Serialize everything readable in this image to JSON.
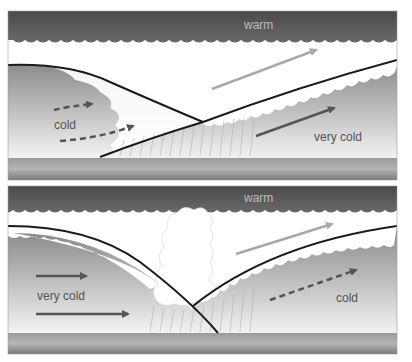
{
  "diagram": {
    "type": "weather-fronts-occlusion",
    "panels": [
      {
        "id": "top",
        "labels": {
          "warm": "warm",
          "cold": "cold",
          "very_cold": "very cold"
        },
        "arrows": [
          {
            "name": "warm-air-arrow",
            "style": "solid",
            "color": "#a0a0a0"
          },
          {
            "name": "very-cold-air-arrow",
            "style": "solid",
            "color": "#555555"
          },
          {
            "name": "cold-air-arrow-upper",
            "style": "dashed",
            "color": "#555555"
          },
          {
            "name": "cold-air-arrow-lower",
            "style": "dashed",
            "color": "#555555"
          }
        ]
      },
      {
        "id": "bottom",
        "labels": {
          "warm": "warm",
          "very_cold": "very cold",
          "cold": "cold"
        },
        "arrows": [
          {
            "name": "warm-air-arrow",
            "style": "solid",
            "color": "#a0a0a0"
          },
          {
            "name": "very-cold-air-arrow-upper",
            "style": "solid",
            "color": "#555555"
          },
          {
            "name": "very-cold-air-arrow-lower",
            "style": "solid",
            "color": "#555555"
          },
          {
            "name": "cold-air-arrow",
            "style": "dashed",
            "color": "#555555"
          }
        ]
      }
    ],
    "colors": {
      "warm_band": "#555555",
      "warm_label": "#bbbbbb",
      "cloud": "#ffffff",
      "cold_mass_top": "#8a8a8a",
      "cold_mass_bottom": "#f2f2f2",
      "ground": "#888888",
      "front_line": "#1a1a1a",
      "label_text": "#555555"
    }
  }
}
